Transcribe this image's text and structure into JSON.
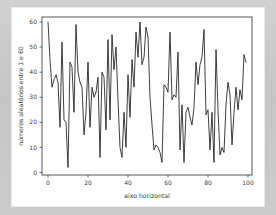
{
  "figure": {
    "background_color": "#ffffff",
    "page_background_color": "#c9c9c9",
    "line_color": "#1c1c1c",
    "axis_color": "#444444"
  },
  "chart_data": {
    "type": "line",
    "title": "",
    "xlabel": "eixo horizontal",
    "ylabel": "números aleatórios entre 1 e 60",
    "xlim": [
      -3,
      102
    ],
    "ylim": [
      -1,
      62
    ],
    "xticks": [
      0,
      20,
      40,
      60,
      80,
      100
    ],
    "xtick_labels": [
      "0",
      "20",
      "40",
      "60",
      "80",
      "100"
    ],
    "yticks": [
      0,
      10,
      20,
      30,
      40,
      50,
      60
    ],
    "ytick_labels": [
      "0",
      "10",
      "20",
      "30",
      "40",
      "50",
      "60"
    ],
    "grid": false,
    "legend": null,
    "series": [
      {
        "name": "números aleatórios",
        "x": [
          0,
          1,
          2,
          3,
          4,
          5,
          6,
          7,
          8,
          9,
          10,
          11,
          12,
          13,
          14,
          15,
          16,
          17,
          18,
          19,
          20,
          21,
          22,
          23,
          24,
          25,
          26,
          27,
          28,
          29,
          30,
          31,
          32,
          33,
          34,
          35,
          36,
          37,
          38,
          39,
          40,
          41,
          42,
          43,
          44,
          45,
          46,
          47,
          48,
          49,
          50,
          51,
          52,
          53,
          54,
          55,
          56,
          57,
          58,
          59,
          60,
          61,
          62,
          63,
          64,
          65,
          66,
          67,
          68,
          69,
          70,
          71,
          72,
          73,
          74,
          75,
          76,
          77,
          78,
          79,
          80,
          81,
          82,
          83,
          84,
          85,
          86,
          87,
          88,
          89,
          90,
          91,
          92,
          93,
          94,
          95,
          96,
          97,
          98,
          99
        ],
        "values": [
          60,
          45,
          34,
          37,
          39,
          36,
          18,
          52,
          21,
          20,
          2,
          44,
          42,
          24,
          59,
          40,
          36,
          34,
          15,
          24,
          44,
          18,
          34,
          30,
          32,
          38,
          6,
          40,
          38,
          17,
          53,
          21,
          55,
          41,
          50,
          29,
          10,
          6,
          24,
          10,
          39,
          22,
          45,
          34,
          56,
          46,
          60,
          43,
          46,
          58,
          54,
          30,
          19,
          9,
          11,
          10,
          8,
          4,
          35,
          34,
          32,
          56,
          29,
          31,
          30,
          48,
          9,
          27,
          4,
          24,
          26,
          22,
          19,
          26,
          44,
          35,
          43,
          46,
          57,
          23,
          25,
          9,
          24,
          4,
          49,
          25,
          7,
          10,
          8,
          27,
          36,
          31,
          11,
          24,
          34,
          25,
          33,
          29,
          47,
          44
        ]
      }
    ]
  }
}
